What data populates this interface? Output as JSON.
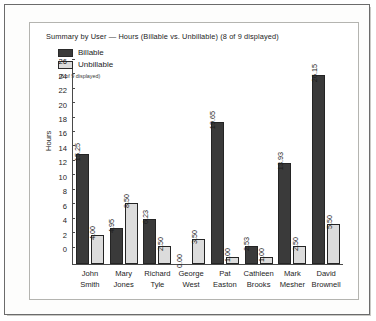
{
  "chart_data": {
    "type": "bar",
    "title": "Summary by User — Hours (Billable vs. Unbillable) (8 of 9 displayed)",
    "subtitle": "(8 of 9 displayed)",
    "xlabel": "",
    "ylabel": "Hours",
    "ylim": [
      0,
      27
    ],
    "yticks": [
      0,
      2,
      4,
      6,
      8,
      10,
      12,
      14,
      16,
      18,
      20,
      22,
      24,
      26
    ],
    "grid": false,
    "legend_position": "top-left",
    "categories": [
      "John Smith",
      "Mary Jones",
      "Richard Tyle",
      "George West",
      "Pat Easton",
      "Cathleen Brooks",
      "Mark Mesher",
      "David Brownell"
    ],
    "category_lines": [
      [
        "John",
        "Smith"
      ],
      [
        "Mary",
        "Jones"
      ],
      [
        "Richard",
        "Tyle"
      ],
      [
        "George",
        "West"
      ],
      [
        "Pat",
        "Easton"
      ],
      [
        "Cathleen",
        "Brooks"
      ],
      [
        "Mark",
        "Mesher"
      ],
      [
        "David",
        "Brownell"
      ]
    ],
    "series": [
      {
        "name": "Billable",
        "color": "#3a3a3a",
        "values": [
          15.25,
          4.95,
          6.23,
          0.0,
          19.65,
          2.53,
          13.93,
          26.15
        ],
        "labels": [
          "15.25",
          "4.95",
          "6.23",
          "0.00",
          "19.65",
          "2.53",
          "13.93",
          "26.15"
        ]
      },
      {
        "name": "Unbillable",
        "color": "#dcdcdc",
        "values": [
          4.0,
          8.5,
          2.5,
          3.5,
          1.0,
          1.0,
          2.5,
          5.5
        ],
        "labels": [
          "4.00",
          "8.50",
          "2.50",
          "3.50",
          "1.00",
          "1.00",
          "2.50",
          "5.50"
        ]
      }
    ]
  }
}
